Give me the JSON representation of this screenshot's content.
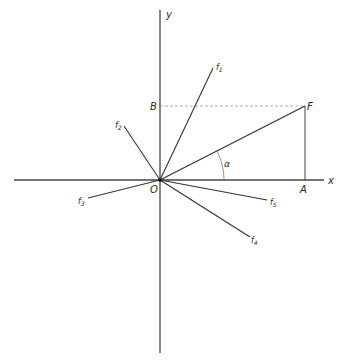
{
  "diagram": {
    "type": "force-vector-decomposition",
    "axes": {
      "x_label": "x",
      "y_label": "y"
    },
    "origin_label": "O",
    "resultant": {
      "label": "F"
    },
    "projections": {
      "x_label": "A",
      "y_label": "B"
    },
    "angle_label": "α",
    "forces": [
      {
        "name": "f",
        "sub": "1"
      },
      {
        "name": "f",
        "sub": "2"
      },
      {
        "name": "f",
        "sub": "3"
      },
      {
        "name": "f",
        "sub": "4"
      },
      {
        "name": "f",
        "sub": "5"
      }
    ],
    "colors": {
      "line": "#333333",
      "dashed": "#999999",
      "axis": "#444444"
    }
  }
}
